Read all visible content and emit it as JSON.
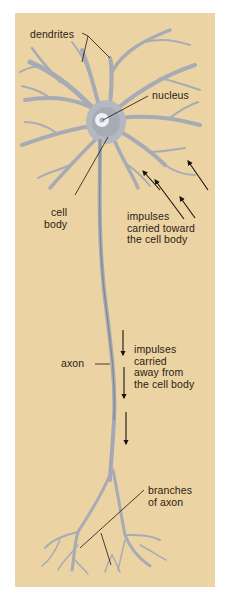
{
  "diagram": {
    "colors": {
      "background": "#ecd3a4",
      "cell": "#b9bcc4",
      "cell_shade": "#8a8e98",
      "nucleus": "#eceef0",
      "arrow": "#1a1410",
      "text": "#2a1d12"
    },
    "labels": {
      "dendrites": "dendrites",
      "nucleus": "nucleus",
      "cell_body": "cell\nbody",
      "impulses_toward": "impulses\ncarried toward\nthe cell body",
      "axon": "axon",
      "impulses_away": "impulses\ncarried\naway from\nthe cell body",
      "branches_of_axon": "branches\nof axon"
    },
    "arrows": {
      "toward_cell_body_count": 4,
      "away_from_cell_body_count": 3
    }
  }
}
